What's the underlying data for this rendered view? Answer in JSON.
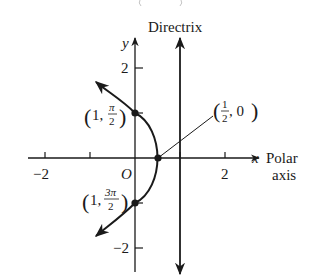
{
  "diagram": {
    "type": "polar-conic-parabola",
    "colors": {
      "ink": "#1a1a1a",
      "background": "#ffffff"
    },
    "labels": {
      "directrix": "Directrix",
      "y_axis": "y",
      "x_axis": "x",
      "polar_axis_line1": "Polar",
      "polar_axis_line2": "axis",
      "origin": "O"
    },
    "ticks": {
      "x": [
        {
          "value": -2,
          "label": "−2"
        },
        {
          "value": -1,
          "label": ""
        },
        {
          "value": 1,
          "label": ""
        },
        {
          "value": 2,
          "label": "2"
        }
      ],
      "y": [
        {
          "value": 2,
          "label": "2"
        },
        {
          "value": -2,
          "label": "−2"
        }
      ]
    },
    "points": [
      {
        "name": "vertex",
        "r": "1/2",
        "theta": "0",
        "label_open": "(",
        "label_num": "1",
        "label_den": "2",
        "label_rest": ", 0",
        "label_close": ")"
      },
      {
        "name": "top",
        "r": "1",
        "theta": "π/2",
        "label_open": "(",
        "label_pre": "1, ",
        "label_num": "π",
        "label_den": "2",
        "label_close": ")"
      },
      {
        "name": "bottom",
        "r": "1",
        "theta": "3π/2",
        "label_open": "(",
        "label_pre": "1, ",
        "label_num": "3π",
        "label_den": "2",
        "label_close": ")"
      }
    ],
    "directrix_x": 1,
    "equation_note": "parabola with focus at pole, directrix x = 1"
  }
}
